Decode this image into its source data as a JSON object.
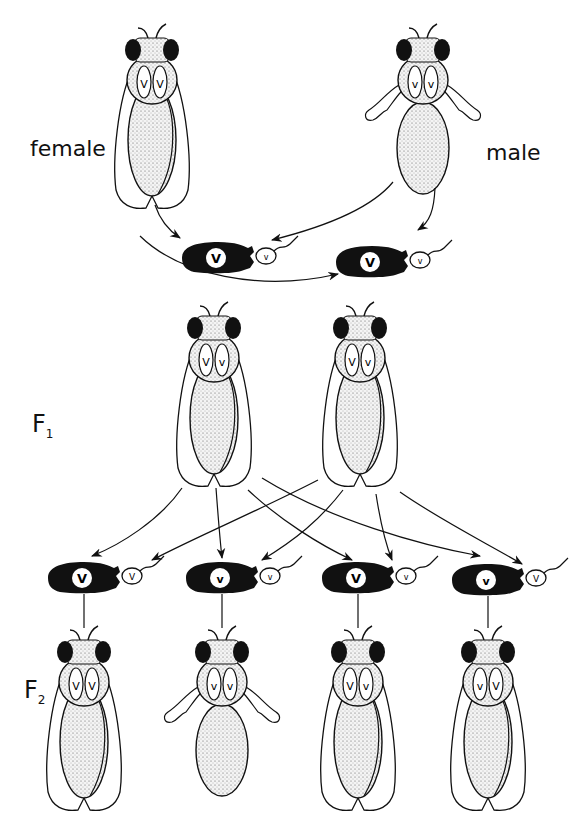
{
  "figure": {
    "labels": {
      "female": "female",
      "male": "male",
      "f1": "F",
      "f1_sub": "1",
      "f2": "F",
      "f2_sub": "2"
    },
    "colors": {
      "ink": "#111111",
      "stipple": "#e6e6e6",
      "background": "#ffffff"
    },
    "parents": [
      {
        "id": "P-female",
        "sex": "female",
        "alleles": [
          "V",
          "V"
        ],
        "wings": "normal"
      },
      {
        "id": "P-male",
        "sex": "male",
        "alleles": [
          "v",
          "v"
        ],
        "wings": "vestigial"
      }
    ],
    "parent_gametes": [
      {
        "egg": "V",
        "sperm": "v"
      },
      {
        "egg": "V",
        "sperm": "v"
      }
    ],
    "f1": [
      {
        "alleles": [
          "V",
          "v"
        ],
        "wings": "normal"
      },
      {
        "alleles": [
          "V",
          "v"
        ],
        "wings": "normal"
      }
    ],
    "f2_gametes": [
      {
        "egg": "V",
        "sperm": "V"
      },
      {
        "egg": "v",
        "sperm": "v"
      },
      {
        "egg": "V",
        "sperm": "v"
      },
      {
        "egg": "v",
        "sperm": "V"
      }
    ],
    "f2": [
      {
        "alleles": [
          "V",
          "V"
        ],
        "wings": "normal"
      },
      {
        "alleles": [
          "v",
          "v"
        ],
        "wings": "vestigial"
      },
      {
        "alleles": [
          "V",
          "v"
        ],
        "wings": "normal"
      },
      {
        "alleles": [
          "v",
          "V"
        ],
        "wings": "normal"
      }
    ]
  }
}
